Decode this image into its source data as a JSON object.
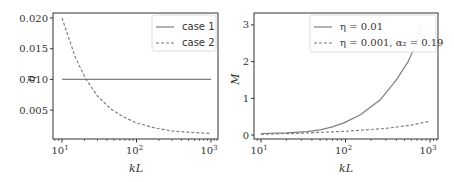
{
  "chart_data": [
    {
      "type": "line",
      "title": "",
      "xlabel": "kL",
      "ylabel": "η",
      "xscale": "log",
      "xlim": [
        8,
        1250
      ],
      "ylim": [
        0.0005,
        0.021
      ],
      "xticks": [
        "10^1",
        "10^2",
        "10^3"
      ],
      "yticks": [
        "0.005",
        "0.010",
        "0.015",
        "0.020"
      ],
      "legend_position": "upper right",
      "grid": false,
      "series": [
        {
          "name": "case 1",
          "style": "solid",
          "x": [
            10,
            1000
          ],
          "y": [
            0.01,
            0.01
          ]
        },
        {
          "name": "case 2",
          "style": "dashed",
          "x": [
            10,
            15,
            21,
            30,
            45,
            64,
            100,
            176,
            300,
            500,
            1000
          ],
          "y": [
            0.02,
            0.0137,
            0.01,
            0.0073,
            0.0052,
            0.004,
            0.0029,
            0.0021,
            0.0016,
            0.0014,
            0.0012
          ]
        }
      ]
    },
    {
      "type": "line",
      "title": "",
      "xlabel": "kL",
      "ylabel": "M",
      "xscale": "log",
      "xlim": [
        8,
        1250
      ],
      "ylim": [
        -0.1,
        3.3
      ],
      "xticks": [
        "10^1",
        "10^2",
        "10^3"
      ],
      "yticks": [
        "0",
        "1",
        "2",
        "3"
      ],
      "legend_position": "upper right",
      "grid": false,
      "series": [
        {
          "name": "η = 0.01",
          "style": "solid",
          "x": [
            10,
            20,
            35,
            50,
            70,
            96,
            150,
            256,
            400,
            550,
            660,
            800
          ],
          "y": [
            0.04,
            0.06,
            0.09,
            0.14,
            0.22,
            0.33,
            0.55,
            0.95,
            1.5,
            2.0,
            2.4,
            3.0
          ]
        },
        {
          "name": "η = 0.001, α₂ = 0.19",
          "style": "dashed",
          "x": [
            10,
            30,
            100,
            300,
            600,
            1000
          ],
          "y": [
            0.02,
            0.05,
            0.1,
            0.18,
            0.27,
            0.38
          ]
        }
      ]
    }
  ],
  "left": {
    "ylabel": "η",
    "xlabel": "kL",
    "yticks": [
      "0.005",
      "0.010",
      "0.015",
      "0.020"
    ],
    "xticks": [
      {
        "base": "10",
        "exp": "1"
      },
      {
        "base": "10",
        "exp": "2"
      },
      {
        "base": "10",
        "exp": "3"
      }
    ],
    "legend": [
      "case 1",
      "case 2"
    ]
  },
  "right": {
    "ylabel": "M",
    "xlabel": "kL",
    "yticks": [
      "0",
      "1",
      "2",
      "3"
    ],
    "xticks": [
      {
        "base": "10",
        "exp": "1"
      },
      {
        "base": "10",
        "exp": "2"
      },
      {
        "base": "10",
        "exp": "3"
      }
    ],
    "legend": [
      "η = 0.01",
      "η = 0.001, α₂ = 0.19"
    ]
  },
  "colors": {
    "line": "#7f7f7f",
    "axis": "#333333"
  }
}
